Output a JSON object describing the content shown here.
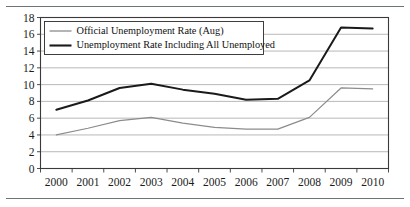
{
  "figure": {
    "top_rule": "horizontal-rule",
    "bottom_rule": "horizontal-rule"
  },
  "chart_data": {
    "type": "line",
    "title": "",
    "xlabel": "",
    "ylabel": "",
    "categories": [
      "2000",
      "2001",
      "2002",
      "2003",
      "2004",
      "2005",
      "2006",
      "2007",
      "2008",
      "2009",
      "2010"
    ],
    "x": [
      2000,
      2001,
      2002,
      2003,
      2004,
      2005,
      2006,
      2007,
      2008,
      2009,
      2010
    ],
    "ylim": [
      0,
      18
    ],
    "yticks": [
      0,
      2,
      4,
      6,
      8,
      10,
      12,
      14,
      16,
      18
    ],
    "ytick_labels": [
      "0",
      "2",
      "4",
      "6",
      "8",
      "10",
      "12",
      "14",
      "16",
      "18"
    ],
    "grid": true,
    "grid_axis": "y",
    "legend_position": "upper-left-inside",
    "series": [
      {
        "name": "Official Unemployment Rate (Aug)",
        "color": "#8c8c8c",
        "line_width": 1.2,
        "values": [
          4.0,
          4.8,
          5.7,
          6.1,
          5.4,
          4.9,
          4.7,
          4.7,
          6.1,
          9.6,
          9.5
        ]
      },
      {
        "name": "Unemployment Rate Including All Unemployed",
        "color": "#1a1a1a",
        "line_width": 2.0,
        "values": [
          7.0,
          8.1,
          9.6,
          10.1,
          9.4,
          8.9,
          8.2,
          8.3,
          10.5,
          16.8,
          16.7
        ]
      }
    ]
  },
  "legend": {
    "entries": [
      {
        "label": "Official Unemployment Rate (Aug)",
        "color": "#8c8c8c"
      },
      {
        "label": "Unemployment Rate Including All Unemployed",
        "color": "#1a1a1a"
      }
    ]
  },
  "colors": {
    "series_light": "#8c8c8c",
    "series_dark": "#1a1a1a",
    "grid": "#9a9a9a",
    "axis": "#3a3a3a",
    "rule": "#555a5e",
    "background": "#ffffff"
  }
}
